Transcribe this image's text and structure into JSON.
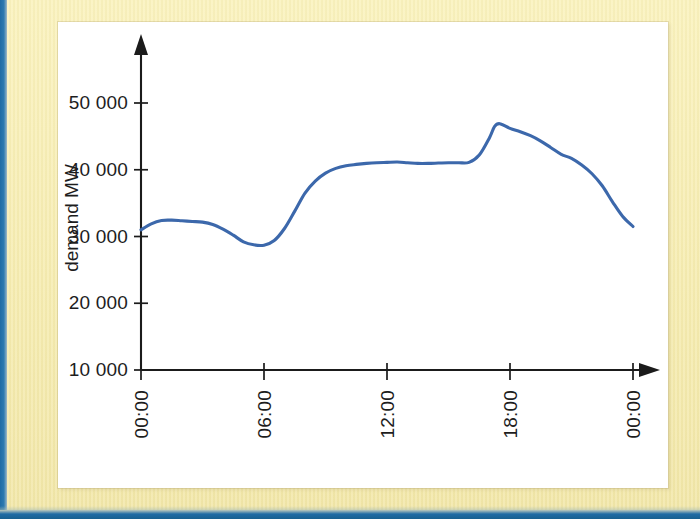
{
  "figure": {
    "frame_color": "#f6edb4",
    "scan_edge_color": "#1f6ba5",
    "plot_background": "#ffffff"
  },
  "chart_data": {
    "type": "line",
    "title": "",
    "xlabel": "",
    "ylabel": "demand MW",
    "line_color": "#3c68ab",
    "axis_color": "#1b1b1b",
    "grid": false,
    "legend": "none",
    "xlim": [
      0,
      24
    ],
    "ylim": [
      10000,
      50000
    ],
    "x_tick_labels": [
      "00:00",
      "06:00",
      "12:00",
      "18:00",
      "00:00"
    ],
    "x_tick_values": [
      0,
      6,
      12,
      18,
      24
    ],
    "y_tick_labels": [
      "10 000",
      "20 000",
      "30 000",
      "40 000",
      "50 000"
    ],
    "y_tick_values": [
      10000,
      20000,
      30000,
      40000,
      50000
    ],
    "x_unit": "hour of day",
    "series": [
      {
        "name": "demand",
        "x": [
          0,
          0.5,
          1,
          1.5,
          2,
          2.5,
          3,
          3.5,
          4,
          4.5,
          5,
          5.5,
          6,
          6.5,
          7,
          7.5,
          8,
          8.5,
          9,
          9.5,
          10,
          10.5,
          11,
          11.5,
          12,
          12.5,
          13,
          13.5,
          14,
          14.5,
          15,
          15.5,
          16,
          16.5,
          17,
          17.25,
          17.5,
          18,
          18.5,
          19,
          19.5,
          20,
          20.5,
          21,
          21.5,
          22,
          22.5,
          23,
          23.5,
          24
        ],
        "values": [
          31000,
          31900,
          32400,
          32450,
          32350,
          32250,
          32150,
          31800,
          31100,
          30200,
          29200,
          28750,
          28700,
          29400,
          31200,
          33800,
          36500,
          38300,
          39500,
          40200,
          40600,
          40800,
          40950,
          41050,
          41100,
          41150,
          41050,
          40950,
          40950,
          41000,
          41050,
          41050,
          41100,
          42200,
          44800,
          46500,
          46900,
          46200,
          45700,
          45100,
          44300,
          43300,
          42300,
          41700,
          40700,
          39400,
          37600,
          35200,
          33000,
          31500
        ]
      }
    ]
  }
}
